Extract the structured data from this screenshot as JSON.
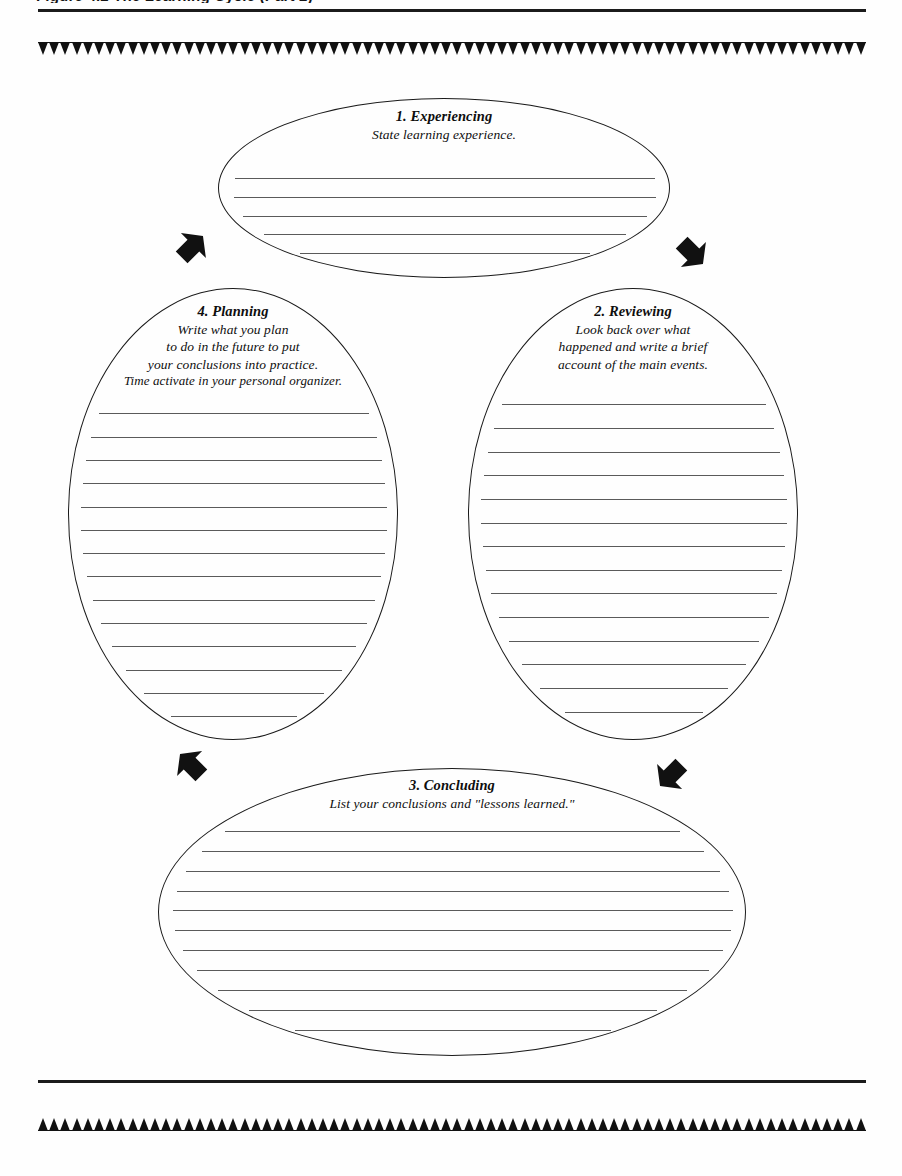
{
  "page": {
    "running_head": "Figure 4.2   The Learning Cycle (Part 2)",
    "background_color": "#fefefe",
    "ink_color": "#111111",
    "rule_color": "#5a5a5a"
  },
  "decor": {
    "top_band_name": "triangle-band-down",
    "bottom_band_name": "triangle-band-up",
    "tooth_count": 74
  },
  "nodes": [
    {
      "id": "experiencing",
      "title": "1. Experiencing",
      "subtitle_lines": [
        "State learning experience."
      ],
      "line_count": 5
    },
    {
      "id": "reviewing",
      "title": "2. Reviewing",
      "subtitle_lines": [
        "Look back over what",
        "happened and write a brief",
        "account of the main events."
      ],
      "line_count": 14
    },
    {
      "id": "concluding",
      "title": "3. Concluding",
      "subtitle_lines": [
        "List your conclusions and \"lessons learned.\""
      ],
      "line_count": 11
    },
    {
      "id": "planning",
      "title": "4. Planning",
      "subtitle_lines": [
        "Write what you plan",
        "to do in the future to put",
        "your conclusions into practice.",
        "Time activate in your personal organizer."
      ],
      "line_count": 14
    }
  ],
  "arrows": [
    {
      "id": "arrow-planning-to-experiencing",
      "direction": "up-right"
    },
    {
      "id": "arrow-experiencing-to-reviewing",
      "direction": "down-right"
    },
    {
      "id": "arrow-concluding-to-planning",
      "direction": "up-left"
    },
    {
      "id": "arrow-reviewing-to-concluding",
      "direction": "down-left"
    }
  ]
}
